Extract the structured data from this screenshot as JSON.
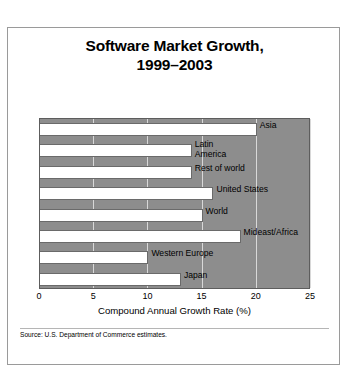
{
  "figure": {
    "title_lines": [
      "Software Market Growth,",
      "1999–2003"
    ],
    "source": "Source: U.S. Department of Commerce estimates."
  },
  "chart_data": {
    "type": "bar",
    "orientation": "horizontal",
    "title": "Software Market Growth, 1999–2003",
    "xlabel": "Compound Annual Growth Rate (%)",
    "ylabel": "",
    "xlim": [
      0,
      25
    ],
    "xticks": [
      0,
      5,
      10,
      15,
      20,
      25
    ],
    "xtick_labels": [
      "0",
      "5",
      "10",
      "15",
      "20",
      "25"
    ],
    "grid": true,
    "legend": "none",
    "plot_background": "#8d8d8d",
    "bar_color": "#ffffff",
    "categories": [
      "Asia",
      "Latin America",
      "Rest of world",
      "United States",
      "World",
      "Mideast/Africa",
      "Western Europe",
      "Japan"
    ],
    "values": [
      20.0,
      14.0,
      14.0,
      16.0,
      15.0,
      18.5,
      10.0,
      13.0
    ],
    "bars": [
      {
        "label": "Asia",
        "value": 20.0,
        "wrap": false
      },
      {
        "label": "Latin America",
        "value": 14.0,
        "wrap": true
      },
      {
        "label": "Rest of world",
        "value": 14.0,
        "wrap": false
      },
      {
        "label": "United States",
        "value": 16.0,
        "wrap": false
      },
      {
        "label": "World",
        "value": 15.0,
        "wrap": false
      },
      {
        "label": "Mideast/Africa",
        "value": 18.5,
        "wrap": false
      },
      {
        "label": "Western Europe",
        "value": 10.0,
        "wrap": false
      },
      {
        "label": "Japan",
        "value": 13.0,
        "wrap": false
      }
    ]
  }
}
